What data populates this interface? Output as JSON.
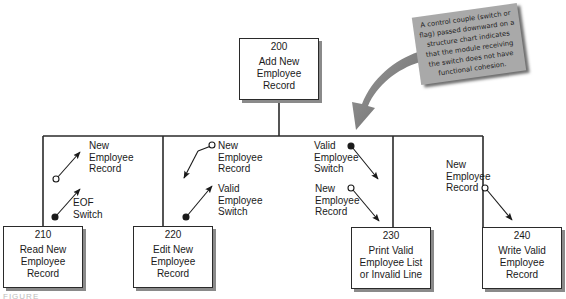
{
  "diagram": {
    "type": "structure-chart",
    "top_module": {
      "number": "200",
      "name": "Add New\nEmployee\nRecord"
    },
    "modules": [
      {
        "number": "210",
        "name": "Read New\nEmployee\nRecord"
      },
      {
        "number": "220",
        "name": "Edit New\nEmployee\nRecord"
      },
      {
        "number": "230",
        "name": "Print Valid\nEmployee List\nor Invalid Line"
      },
      {
        "number": "240",
        "name": "Write Valid\nEmployee\nRecord"
      }
    ],
    "couples": [
      {
        "module": "210",
        "label": "New\nEmployee\nRecord",
        "kind": "data",
        "direction": "up"
      },
      {
        "module": "210",
        "label": "EOF\nSwitch",
        "kind": "control",
        "direction": "up"
      },
      {
        "module": "220",
        "label": "New\nEmployee\nRecord",
        "kind": "data",
        "direction": "down"
      },
      {
        "module": "220",
        "label": "Valid\nEmployee\nSwitch",
        "kind": "control",
        "direction": "up"
      },
      {
        "module": "230",
        "label": "Valid\nEmployee\nSwitch",
        "kind": "control",
        "direction": "down"
      },
      {
        "module": "230",
        "label": "New\nEmployee\nRecord",
        "kind": "data",
        "direction": "down"
      },
      {
        "module": "240",
        "label": "New\nEmployee\nRecord",
        "kind": "data",
        "direction": "down"
      }
    ],
    "note": "A control couple (switch or flag) passed downward on a structure chart indicates that the module receiving the switch does not have functional cohesion.",
    "caption": "FIGURE",
    "colors": {
      "line": "#2a2a2a",
      "note_bg": "#a9a9a9",
      "pointer_arrow": "#7a7a7a",
      "shadow": "#8a8a8a"
    }
  }
}
